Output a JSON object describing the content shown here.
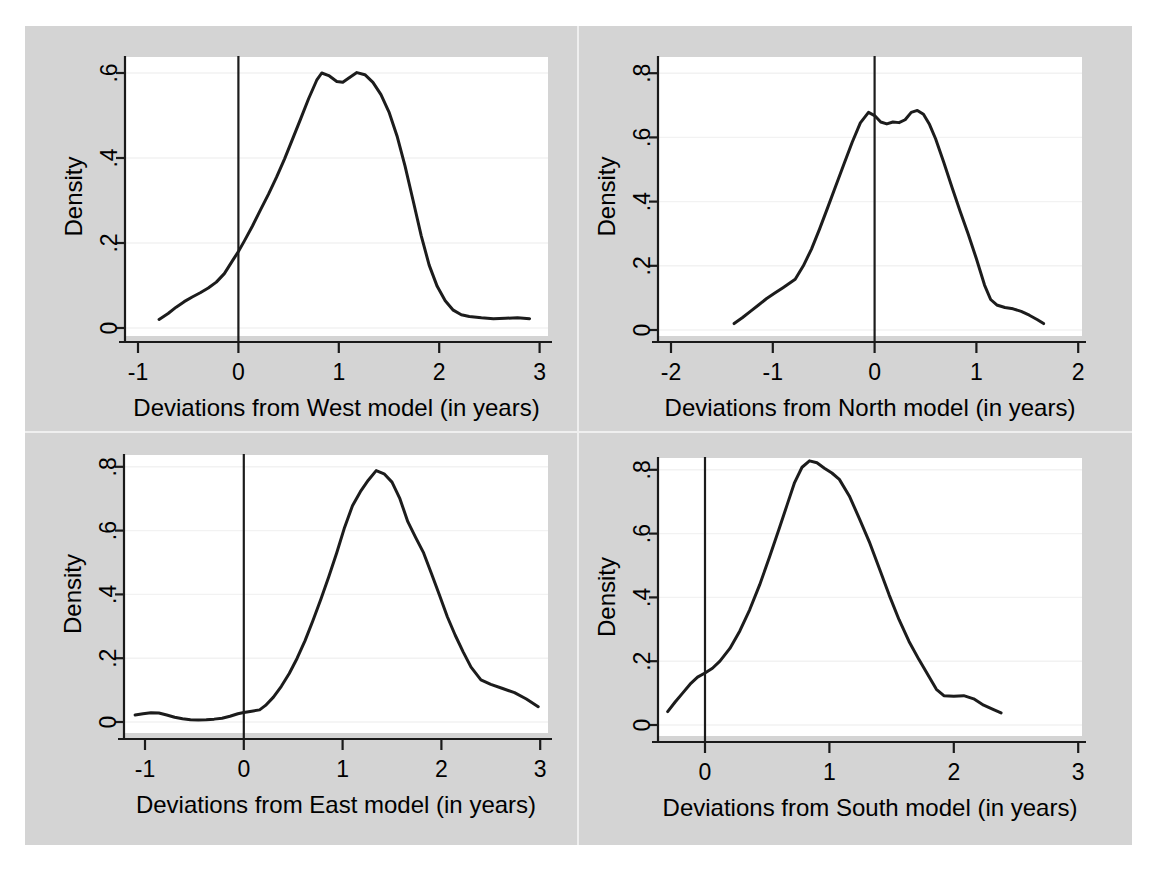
{
  "figure": {
    "background_color": "#d4d4d4",
    "panel_background_color": "#ffffff",
    "curve_color": "#1c1c1c",
    "grid_color": "#f2f2f2",
    "axis_color": "#1a1a1a",
    "panel_count": 4,
    "layout": "2x2"
  },
  "chart_data": [
    {
      "type": "line",
      "id": "west",
      "title": "",
      "xlabel": "Deviations from West model (in years)",
      "ylabel": "Density",
      "xlim": [
        -0.9,
        3.08
      ],
      "ylim": [
        -0.02,
        0.645
      ],
      "xticks": [
        -1,
        0,
        1,
        2,
        3
      ],
      "xticklabels": [
        "-1",
        "0",
        "1",
        "2",
        "3"
      ],
      "yticks": [
        0,
        0.2,
        0.4,
        0.6
      ],
      "yticklabels": [
        "0",
        ".2",
        ".4",
        ".6"
      ],
      "grid": true,
      "reference_line_x": 0,
      "x": [
        -0.79,
        -0.7,
        -0.62,
        -0.54,
        -0.46,
        -0.38,
        -0.3,
        -0.22,
        -0.14,
        -0.06,
        0.0,
        0.06,
        0.14,
        0.22,
        0.3,
        0.38,
        0.46,
        0.54,
        0.62,
        0.7,
        0.78,
        0.83,
        0.9,
        0.98,
        1.04,
        1.1,
        1.18,
        1.26,
        1.34,
        1.42,
        1.5,
        1.58,
        1.66,
        1.74,
        1.82,
        1.9,
        1.98,
        2.06,
        2.14,
        2.22,
        2.3,
        2.42,
        2.54,
        2.66,
        2.78,
        2.9
      ],
      "y": [
        0.02,
        0.034,
        0.049,
        0.062,
        0.073,
        0.083,
        0.094,
        0.108,
        0.128,
        0.158,
        0.18,
        0.205,
        0.24,
        0.278,
        0.315,
        0.355,
        0.398,
        0.445,
        0.492,
        0.54,
        0.583,
        0.6,
        0.594,
        0.58,
        0.578,
        0.588,
        0.601,
        0.596,
        0.578,
        0.549,
        0.508,
        0.452,
        0.381,
        0.3,
        0.218,
        0.148,
        0.098,
        0.064,
        0.042,
        0.031,
        0.027,
        0.024,
        0.022,
        0.023,
        0.024,
        0.022
      ]
    },
    {
      "type": "line",
      "id": "north",
      "title": "",
      "xlabel": "Deviations from North model (in years)",
      "ylabel": "Density",
      "xlim": [
        -2.05,
        2.05
      ],
      "ylim": [
        -0.025,
        0.86
      ],
      "xticks": [
        -2,
        -1,
        0,
        1,
        2
      ],
      "xticklabels": [
        "-2",
        "-1",
        "0",
        "1",
        "2"
      ],
      "yticks": [
        0,
        0.2,
        0.4,
        0.6,
        0.8
      ],
      "yticklabels": [
        "0",
        ".2",
        ".4",
        ".6",
        ".8"
      ],
      "grid": true,
      "reference_line_x": 0,
      "x": [
        -1.38,
        -1.3,
        -1.22,
        -1.14,
        -1.06,
        -0.98,
        -0.9,
        -0.84,
        -0.78,
        -0.7,
        -0.62,
        -0.54,
        -0.46,
        -0.38,
        -0.3,
        -0.22,
        -0.14,
        -0.06,
        0.0,
        0.06,
        0.12,
        0.18,
        0.24,
        0.3,
        0.36,
        0.42,
        0.48,
        0.54,
        0.6,
        0.68,
        0.76,
        0.84,
        0.92,
        1.0,
        1.08,
        1.14,
        1.2,
        1.28,
        1.36,
        1.44,
        1.52,
        1.6,
        1.66
      ],
      "y": [
        0.02,
        0.038,
        0.058,
        0.078,
        0.098,
        0.115,
        0.132,
        0.145,
        0.158,
        0.2,
        0.252,
        0.315,
        0.382,
        0.45,
        0.518,
        0.585,
        0.645,
        0.678,
        0.668,
        0.648,
        0.642,
        0.648,
        0.646,
        0.655,
        0.678,
        0.684,
        0.672,
        0.64,
        0.595,
        0.522,
        0.445,
        0.37,
        0.298,
        0.222,
        0.14,
        0.095,
        0.078,
        0.07,
        0.066,
        0.058,
        0.046,
        0.032,
        0.02
      ]
    },
    {
      "type": "line",
      "id": "east",
      "title": "",
      "xlabel": "Deviations from East model (in years)",
      "ylabel": "Density",
      "xlim": [
        -1.2,
        3.08
      ],
      "ylim": [
        -0.025,
        0.855
      ],
      "xticks": [
        -1,
        0,
        1,
        2,
        3
      ],
      "xticklabels": [
        "-1",
        "0",
        "1",
        "2",
        "3"
      ],
      "yticks": [
        0,
        0.2,
        0.4,
        0.6,
        0.8
      ],
      "yticklabels": [
        "0",
        ".2",
        ".4",
        ".6",
        ".8"
      ],
      "grid": true,
      "reference_line_x": 0,
      "x": [
        -1.1,
        -1.02,
        -0.94,
        -0.86,
        -0.78,
        -0.7,
        -0.62,
        -0.54,
        -0.46,
        -0.38,
        -0.3,
        -0.22,
        -0.14,
        -0.06,
        0.0,
        0.08,
        0.16,
        0.22,
        0.3,
        0.38,
        0.46,
        0.54,
        0.62,
        0.7,
        0.78,
        0.86,
        0.94,
        1.02,
        1.1,
        1.18,
        1.26,
        1.34,
        1.42,
        1.5,
        1.58,
        1.66,
        1.74,
        1.82,
        1.9,
        1.98,
        2.06,
        2.14,
        2.22,
        2.3,
        2.4,
        2.5,
        2.62,
        2.74,
        2.86,
        2.98
      ],
      "y": [
        0.022,
        0.026,
        0.029,
        0.028,
        0.022,
        0.015,
        0.01,
        0.007,
        0.006,
        0.007,
        0.009,
        0.012,
        0.018,
        0.026,
        0.03,
        0.034,
        0.038,
        0.052,
        0.078,
        0.112,
        0.152,
        0.2,
        0.255,
        0.318,
        0.385,
        0.455,
        0.53,
        0.61,
        0.678,
        0.722,
        0.758,
        0.788,
        0.778,
        0.752,
        0.7,
        0.628,
        0.578,
        0.53,
        0.465,
        0.398,
        0.33,
        0.272,
        0.22,
        0.172,
        0.132,
        0.118,
        0.105,
        0.092,
        0.072,
        0.048
      ]
    },
    {
      "type": "line",
      "id": "south",
      "title": "",
      "xlabel": "Deviations from South model (in years)",
      "ylabel": "Density",
      "xlim": [
        -0.42,
        3.05
      ],
      "ylim": [
        -0.025,
        0.875
      ],
      "xticks": [
        0,
        1,
        2,
        3
      ],
      "xticklabels": [
        "0",
        "1",
        "2",
        "3"
      ],
      "yticks": [
        0,
        0.2,
        0.4,
        0.6,
        0.8
      ],
      "yticklabels": [
        "0",
        ".2",
        ".4",
        ".6",
        ".8"
      ],
      "grid": true,
      "reference_line_x": 0,
      "x": [
        -0.3,
        -0.24,
        -0.18,
        -0.12,
        -0.06,
        0.0,
        0.06,
        0.12,
        0.2,
        0.28,
        0.36,
        0.44,
        0.52,
        0.6,
        0.66,
        0.72,
        0.78,
        0.84,
        0.9,
        0.96,
        1.02,
        1.08,
        1.16,
        1.24,
        1.32,
        1.4,
        1.48,
        1.56,
        1.64,
        1.72,
        1.8,
        1.86,
        1.92,
        2.0,
        2.08,
        2.16,
        2.24,
        2.32,
        2.38
      ],
      "y": [
        0.042,
        0.072,
        0.1,
        0.128,
        0.15,
        0.163,
        0.178,
        0.2,
        0.24,
        0.295,
        0.362,
        0.44,
        0.528,
        0.62,
        0.69,
        0.76,
        0.808,
        0.828,
        0.822,
        0.805,
        0.79,
        0.77,
        0.718,
        0.648,
        0.575,
        0.492,
        0.408,
        0.33,
        0.262,
        0.205,
        0.152,
        0.112,
        0.092,
        0.09,
        0.092,
        0.082,
        0.062,
        0.048,
        0.038
      ]
    }
  ]
}
